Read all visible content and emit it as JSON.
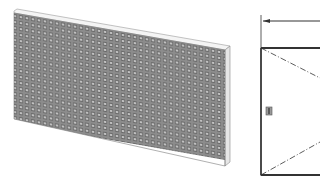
{
  "figure": {
    "left_view": {
      "label": "isometric view of perforated panel",
      "panel_color": "#8a8a8a",
      "cell_color": "#6e6e6e",
      "hole_color": "#cfcfcf",
      "edge_color": "#f2f2f2"
    },
    "right_view": {
      "label": "front elevation drawing",
      "line_color": "#333333",
      "marker_color": "#555555",
      "marker_glyph": "I"
    }
  }
}
